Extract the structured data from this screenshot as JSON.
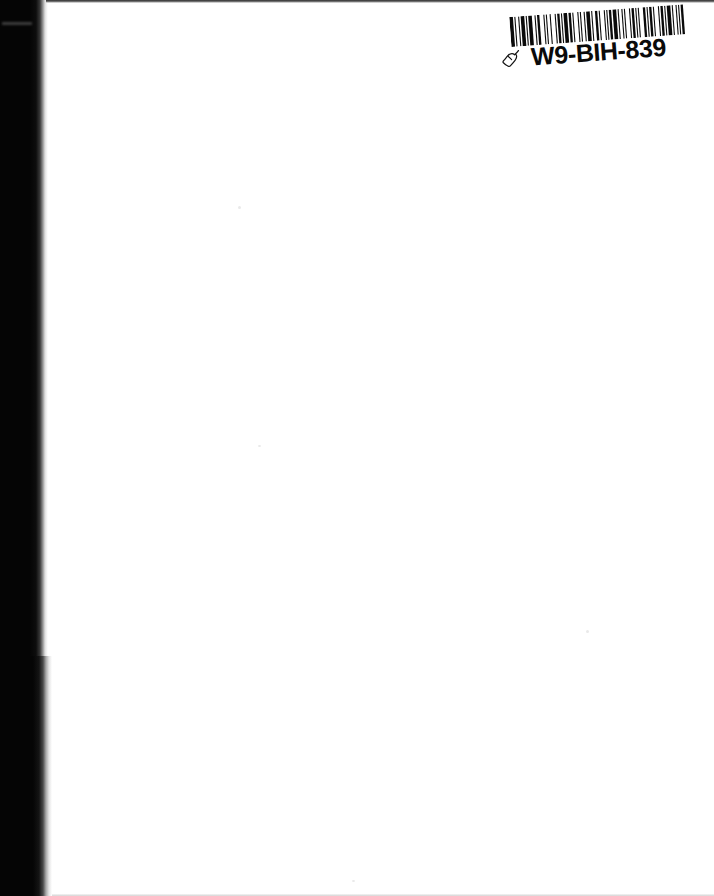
{
  "page": {
    "kind": "scanned-blank-page",
    "background_color": "#ffffff",
    "width_px": 714,
    "height_px": 896,
    "body_text": ""
  },
  "scan_artifacts": {
    "left_shadow_color": "#050505",
    "top_edge_color": "#1a1a1a",
    "bottom_edge_color": "#c9c9c9",
    "spine_streak_label": "scan-streak"
  },
  "barcode_label": {
    "code_text": "W9-BIH-839",
    "ink_color": "#0a0a0a",
    "rotation_deg": -4.2,
    "hand_icon_name": "pointing-hand-icon",
    "bars": [
      3,
      1,
      1,
      2,
      1,
      1,
      3,
      1,
      1,
      1,
      3,
      2,
      1,
      1,
      2,
      3,
      1,
      1,
      1,
      2,
      1,
      3,
      1,
      1,
      2,
      1,
      1,
      1,
      3,
      1,
      2,
      1,
      1,
      3,
      1,
      1,
      1,
      2,
      1,
      1,
      3,
      1,
      1,
      2,
      2,
      1,
      1,
      3,
      1,
      1,
      1,
      1,
      2,
      1,
      3,
      1,
      1,
      2,
      1,
      1,
      1,
      3,
      1,
      1,
      2,
      1,
      1,
      1,
      1,
      3,
      2,
      1,
      1,
      1,
      2,
      1,
      1,
      3,
      1,
      1,
      2,
      1,
      1,
      1,
      3,
      1,
      1,
      2,
      1,
      1,
      1,
      1,
      2,
      3
    ]
  }
}
